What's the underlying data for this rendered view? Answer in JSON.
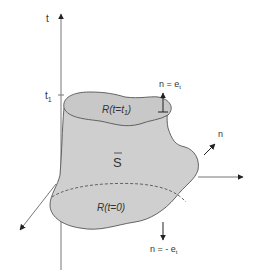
{
  "diagram": {
    "axes": {
      "t_label": "t",
      "t1_label": "t",
      "t1_subscript": "1"
    },
    "labels": {
      "top_region": "R(t=t",
      "top_region_sub": "1",
      "top_region_close": ")",
      "bottom_region": "R(t=0)",
      "surface": "S",
      "normal_top": "n = e",
      "normal_top_sub": "t",
      "normal_side": "n",
      "normal_bottom": "n = - e",
      "normal_bottom_sub": "t"
    },
    "colors": {
      "fill": "#cfcfcf",
      "fill_top": "#c4c4c4",
      "stroke": "#555555",
      "axis": "#666666",
      "text": "#333333"
    }
  }
}
